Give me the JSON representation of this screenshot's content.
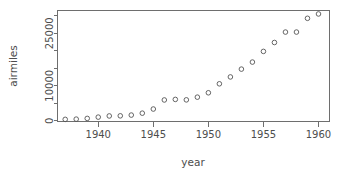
{
  "chart_data": {
    "type": "scatter",
    "title": "",
    "subtitle": "",
    "xlabel": "year",
    "ylabel": "airmiles",
    "x": [
      1937,
      1938,
      1939,
      1940,
      1941,
      1942,
      1943,
      1944,
      1945,
      1946,
      1947,
      1948,
      1949,
      1950,
      1951,
      1952,
      1953,
      1954,
      1955,
      1956,
      1957,
      1958,
      1959,
      1960
    ],
    "values": [
      412,
      480,
      683,
      1052,
      1385,
      1418,
      1634,
      2178,
      3362,
      5948,
      6109,
      5981,
      6753,
      8003,
      10566,
      12528,
      14760,
      16769,
      19819,
      22362,
      25340,
      25343,
      29269,
      30514
    ],
    "series": [
      {
        "name": "airmiles",
        "values": [
          412,
          480,
          683,
          1052,
          1385,
          1418,
          1634,
          2178,
          3362,
          5948,
          6109,
          5981,
          6753,
          8003,
          10566,
          12528,
          14760,
          16769,
          19819,
          22362,
          25340,
          25343,
          29269,
          30514
        ]
      }
    ],
    "xlim": [
      1936.3,
      1961.0
    ],
    "ylim": [
      -200,
      31500
    ],
    "xticks": [
      1940,
      1945,
      1950,
      1955,
      1960
    ],
    "xtick_labels": [
      "1940",
      "1945",
      "1950",
      "1955",
      "1960"
    ],
    "yticks": [
      0,
      5000,
      10000,
      15000,
      20000,
      25000,
      30000
    ],
    "ytick_labels": [
      "0",
      "",
      "10000",
      "",
      "",
      "25000",
      ""
    ],
    "ylabeled_ticks": [
      0,
      10000,
      25000
    ],
    "ylabeled_text": [
      "0",
      "10000",
      "25000"
    ],
    "grid": false,
    "legend": false,
    "legend_position": "none",
    "marker": "open-circle",
    "marker_color": "#555555",
    "axis_color": "#6e6e6e",
    "background": "#ffffff",
    "box_style": "full-rectangle"
  },
  "figure": {
    "y_axis_title": "airmiles",
    "x_axis_title": "year"
  }
}
